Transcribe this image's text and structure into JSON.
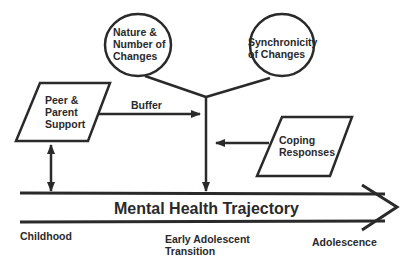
{
  "diagram": {
    "nodes": {
      "nature": {
        "lines": [
          "Nature &",
          "Number of",
          "Changes"
        ],
        "shape": "ellipse"
      },
      "synchronicity": {
        "lines": [
          "Synchronicity",
          "of Changes"
        ],
        "shape": "ellipse"
      },
      "peer": {
        "lines": [
          "Peer &",
          "Parent",
          "Support"
        ],
        "shape": "parallelogram"
      },
      "coping": {
        "lines": [
          "Coping",
          "Responses"
        ],
        "shape": "parallelogram"
      }
    },
    "edges": {
      "buffer_label": "Buffer"
    },
    "trajectory": {
      "label": "Mental Health Trajectory",
      "stages": [
        "Childhood",
        "Early Adolescent",
        "Transition",
        "Adolescence"
      ]
    },
    "colors": {
      "stroke": "#2a2a2a",
      "background": "#ffffff"
    }
  }
}
